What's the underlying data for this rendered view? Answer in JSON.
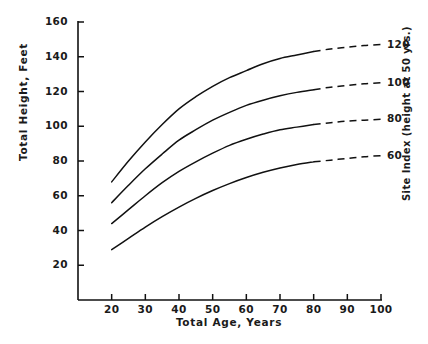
{
  "chart_data": {
    "type": "line",
    "title": "",
    "xlabel": "Total Age, Years",
    "ylabel": "Total Height, Feet",
    "rlabel": "Site Index (height at 50 yrs.)",
    "xlim": [
      10,
      100
    ],
    "ylim": [
      0,
      160
    ],
    "xticks": [
      20,
      30,
      40,
      50,
      60,
      70,
      80,
      90,
      100
    ],
    "yticks": [
      20,
      40,
      60,
      80,
      100,
      120,
      140,
      160
    ],
    "xtick_labels": [
      "20",
      "30",
      "40",
      "50",
      "60",
      "70",
      "80",
      "90",
      "100"
    ],
    "ytick_labels": [
      "20",
      "40",
      "60",
      "80",
      "100",
      "120",
      "140",
      "160"
    ],
    "grid": false,
    "legend_position": "right-curve-labels",
    "solid_range": [
      20,
      80
    ],
    "dashed_range": [
      80,
      100
    ],
    "x": [
      20,
      25,
      30,
      35,
      40,
      45,
      50,
      55,
      60,
      65,
      70,
      75,
      80,
      85,
      90,
      95,
      100
    ],
    "series": [
      {
        "name": "120",
        "label": "120",
        "values": [
          68,
          80,
          91,
          101,
          110,
          117,
          123,
          128,
          132,
          136,
          139,
          141,
          143,
          144.5,
          145.5,
          146.5,
          147
        ]
      },
      {
        "name": "100",
        "label": "100",
        "values": [
          56,
          66,
          75.5,
          84,
          92,
          98,
          103.5,
          108,
          112,
          115,
          117.5,
          119.5,
          121,
          122.5,
          123.5,
          124.5,
          125
        ]
      },
      {
        "name": "80",
        "label": "80",
        "values": [
          44,
          52,
          60,
          67.5,
          74,
          79.5,
          84.5,
          89,
          92.5,
          95.5,
          98,
          99.5,
          101,
          102,
          103,
          103.5,
          104
        ]
      },
      {
        "name": "60",
        "label": "60",
        "values": [
          29,
          35.5,
          42,
          48,
          53.5,
          58.5,
          63,
          67,
          70.5,
          73.5,
          76,
          78,
          79.5,
          80.5,
          81.5,
          82.5,
          83
        ]
      }
    ]
  },
  "caption": ""
}
